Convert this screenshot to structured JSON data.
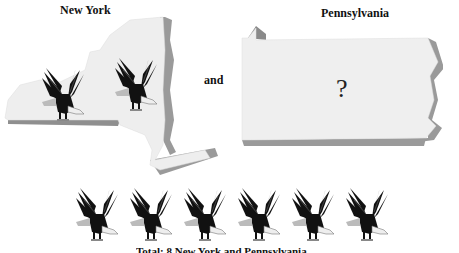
{
  "labels": {
    "new_york": "New York",
    "pennsylvania": "Pennsylvania",
    "conjunction": "and",
    "unknown": "?"
  },
  "new_york": {
    "eagle_count": 2,
    "icon": "eagle-icon"
  },
  "pennsylvania": {
    "eagle_count": "?",
    "icon": "eagle-icon"
  },
  "total_row": {
    "eagle_count": 6,
    "icon": "eagle-icon"
  },
  "caption": "Total: 8 New York and Pennsylvania",
  "colors": {
    "map_face": "#efefef",
    "map_edge": "#9a9a9a",
    "eagle_body": "#111111",
    "eagle_head": "#f4f4f4",
    "background": "#ffffff"
  }
}
